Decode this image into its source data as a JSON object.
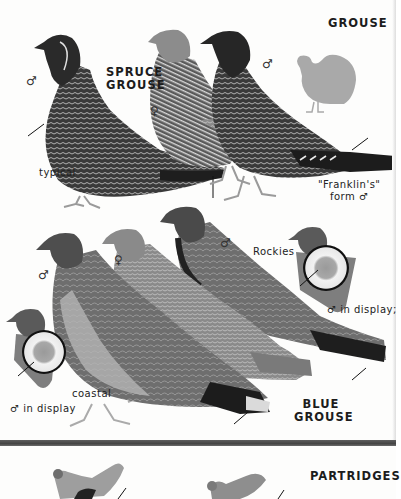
{
  "plate": {
    "section_title": "GROUSE",
    "spruce_grouse": {
      "title_line1": "SPRUCE",
      "title_line2": "GROUSE",
      "male_symbol_left": "♂",
      "female_symbol": "♀",
      "male_symbol_right": "♂",
      "label_typical": "typical",
      "label_franklins_line1": "\"Franklin's\"",
      "label_franklins_line2": "form ♂"
    },
    "blue_grouse": {
      "title_line1": "BLUE",
      "title_line2": "GROUSE",
      "male_symbol_left": "♂",
      "female_symbol": "♀",
      "male_symbol_rockies": "♂",
      "label_rockies": "Rockies",
      "label_coastal": "coastal",
      "label_display_right": "♂  in display;",
      "label_display_left": "♂  in display"
    },
    "partridges": {
      "section_title": "PARTRIDGES"
    }
  },
  "colors": {
    "divider": "#4a4a4a",
    "silhouette": "#a9a9a9",
    "ink": "#1a1a1a"
  }
}
